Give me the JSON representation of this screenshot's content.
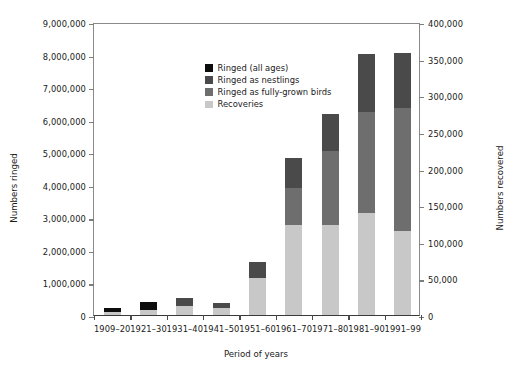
{
  "chart_data": {
    "type": "bar",
    "subtype": "stacked-bar-dual-axis",
    "title": "",
    "xlabel": "Period of years",
    "ylabel": "Numbers ringed",
    "ylabel_right": "Numbers recovered",
    "categories": [
      "1909–20",
      "1921–30",
      "1931–40",
      "1941–50",
      "1951–60",
      "1961–70",
      "1971–80",
      "1981–90",
      "1991–99"
    ],
    "ylim": [
      0,
      9000000
    ],
    "ylim_right": [
      0,
      400000
    ],
    "yticks": [
      0,
      1000000,
      2000000,
      3000000,
      4000000,
      5000000,
      6000000,
      7000000,
      8000000,
      9000000
    ],
    "ytick_labels": [
      "0",
      "1,000,000",
      "2,000,000",
      "3,000,000",
      "4,000,000",
      "5,000,000",
      "6,000,000",
      "7,000,000",
      "8,000,000",
      "9,000,000"
    ],
    "yticks_right": [
      0,
      50000,
      100000,
      150000,
      200000,
      250000,
      300000,
      350000,
      400000
    ],
    "ytick_labels_right": [
      "0",
      "50,000",
      "100,000",
      "150,000",
      "200,000",
      "250,000",
      "300,000",
      "350,000",
      "400,000"
    ],
    "grid": false,
    "legend_position": "top-left-inside",
    "series": [
      {
        "name": "Ringed (all ages)",
        "color": "#0d0d0d",
        "axis": "left",
        "values": [
          120000,
          250000,
          0,
          0,
          0,
          0,
          0,
          0,
          0
        ]
      },
      {
        "name": "Ringed as nestlings",
        "color": "#4a4a4a",
        "axis": "left",
        "values": [
          0,
          0,
          230000,
          150000,
          480000,
          920000,
          1110000,
          1780000,
          1690000
        ]
      },
      {
        "name": "Ringed as fully-grown birds",
        "color": "#6e6e6e",
        "axis": "left",
        "values": [
          0,
          0,
          0,
          0,
          0,
          1130000,
          2270000,
          3120000,
          3780000
        ]
      },
      {
        "name": "Recoveries",
        "color": "#c8c8c8",
        "axis": "right",
        "values": [
          4000,
          7000,
          13000,
          10000,
          51000,
          123000,
          123000,
          138000,
          114000
        ],
        "values_as_left_scale": [
          90000,
          150000,
          290000,
          220000,
          1150000,
          2780000,
          2780000,
          3120000,
          2570000
        ]
      }
    ],
    "bar_totals_ringed": [
      "120,000",
      "250,000",
      "230,000",
      "150,000",
      "480,000",
      "2,050,000",
      "3,380,000",
      "4,900,000",
      "5,470,000"
    ]
  },
  "legend": {
    "items": [
      {
        "label": "Ringed (all ages)",
        "color": "#0d0d0d"
      },
      {
        "label": "Ringed as nestlings",
        "color": "#4a4a4a"
      },
      {
        "label": "Ringed as fully-grown birds",
        "color": "#6e6e6e"
      },
      {
        "label": "Recoveries",
        "color": "#c8c8c8"
      }
    ]
  }
}
